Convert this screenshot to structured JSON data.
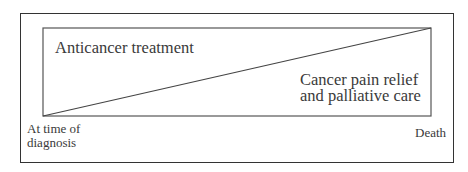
{
  "diagram": {
    "type": "area-split",
    "regions": [
      {
        "id": "upper",
        "label": "Anticancer treatment"
      },
      {
        "id": "lower",
        "label_lines": [
          "Cancer pain relief",
          "and palliative care"
        ]
      }
    ],
    "axis": {
      "start_label_lines": [
        "At time of",
        "diagnosis"
      ],
      "end_label": "Death"
    },
    "colors": {
      "line": "#333333",
      "text": "#3a3a3a",
      "background": "#ffffff"
    }
  }
}
